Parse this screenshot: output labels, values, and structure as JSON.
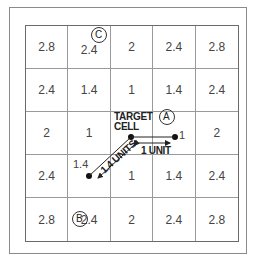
{
  "diagram": {
    "grid": [
      [
        "2.8",
        "2.4",
        "2",
        "2.4",
        "2.8"
      ],
      [
        "2.4",
        "1.4",
        "1",
        "1.4",
        "2.4"
      ],
      [
        "2",
        "1",
        "",
        "",
        "2"
      ],
      [
        "2.4",
        "",
        "1",
        "1.4",
        "2.4"
      ],
      [
        "2.8",
        "2.4",
        "2",
        "2.4",
        "2.8"
      ]
    ],
    "target_label_line1": "TARGET",
    "target_label_line2": "CELL",
    "point_a_label": "A",
    "point_b_label": "B",
    "point_c_label": "C",
    "point_a_value": "1",
    "point_b_value": "1.4",
    "arrow_horizontal_label": "1 UNIT",
    "arrow_diagonal_label": "1.4 UNITS",
    "colors": {
      "line": "#333333",
      "grid": "#9a9a9a",
      "text": "#444444"
    }
  }
}
